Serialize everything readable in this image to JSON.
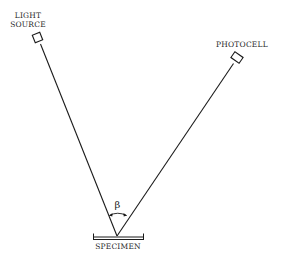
{
  "diagram": {
    "type": "optical-geometry",
    "labels": {
      "light_source_line1": "LIGHT",
      "light_source_line2": "SOURCE",
      "photocell": "PHOTOCELL",
      "specimen": "SPECIMEN",
      "angle": "β"
    },
    "nodes": [
      {
        "id": "light-source",
        "label": "LIGHT SOURCE",
        "x": 38,
        "y": 38
      },
      {
        "id": "photocell",
        "label": "PHOTOCELL",
        "x": 238,
        "y": 58
      },
      {
        "id": "specimen",
        "label": "SPECIMEN",
        "x": 118,
        "y": 237
      }
    ],
    "edges": [
      {
        "from": "light-source",
        "to": "specimen",
        "type": "incident-ray"
      },
      {
        "from": "specimen",
        "to": "photocell",
        "type": "reflected-ray"
      }
    ],
    "angle_annotation": {
      "symbol": "β",
      "between": [
        "incident-ray",
        "reflected-ray"
      ],
      "vertex": "specimen"
    },
    "colors": {
      "stroke": "#1a1a1a",
      "text": "#2a2a2a",
      "background": "#ffffff"
    }
  }
}
